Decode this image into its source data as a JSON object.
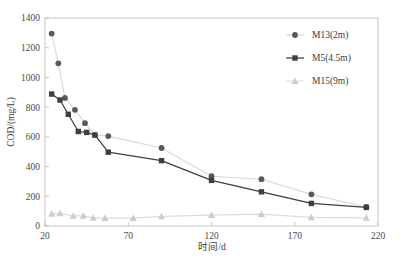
{
  "chart_data": {
    "type": "line",
    "title": "",
    "xlabel": "时间/d",
    "ylabel": "COD/(mg/L)",
    "xlim": [
      20,
      220
    ],
    "ylim": [
      0,
      1400
    ],
    "xticks": [
      20,
      70,
      120,
      170,
      220
    ],
    "yticks": [
      0,
      200,
      400,
      600,
      800,
      1000,
      1200,
      1400
    ],
    "grid": false,
    "legend_position": "top-right",
    "series": [
      {
        "name": "M13(2m)",
        "marker": "circle",
        "color": "#595959",
        "line_color": "#d8d8d8",
        "x": [
          24,
          28,
          32,
          38,
          44,
          50,
          58,
          90,
          120,
          150,
          180,
          213
        ],
        "y": [
          1295,
          1095,
          862,
          782,
          692,
          612,
          605,
          525,
          335,
          315,
          213,
          128
        ]
      },
      {
        "name": "M5(4.5m)",
        "marker": "square",
        "color": "#3f3f3f",
        "line_color": "#3f3f3f",
        "x": [
          24,
          29,
          34,
          40,
          45,
          50,
          58,
          90,
          120,
          150,
          180,
          213
        ],
        "y": [
          888,
          848,
          752,
          636,
          630,
          612,
          497,
          440,
          307,
          230,
          152,
          125
        ]
      },
      {
        "name": "M15(9m)",
        "marker": "triangle",
        "color": "#cccccc",
        "line_color": "#dcdcdc",
        "x": [
          24,
          29,
          37,
          43,
          49,
          56,
          73,
          90,
          120,
          150,
          180,
          213
        ],
        "y": [
          82,
          85,
          68,
          68,
          55,
          53,
          53,
          65,
          73,
          80,
          58,
          55
        ]
      }
    ]
  },
  "legend": {
    "items": [
      {
        "label": "M13(2m)"
      },
      {
        "label": "M5(4.5m)"
      },
      {
        "label": "M15(9m)"
      }
    ]
  },
  "axes": {
    "x_title": "时间/d",
    "y_title": "COD/(mg/L)",
    "x_tick_labels": [
      "20",
      "70",
      "120",
      "170",
      "220"
    ],
    "y_tick_labels": [
      "0",
      "200",
      "400",
      "600",
      "800",
      "1000",
      "1200",
      "1400"
    ]
  }
}
